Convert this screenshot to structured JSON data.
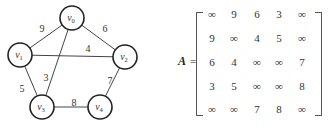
{
  "graph": {
    "nodes": [
      {
        "id": "v0",
        "base": "v",
        "sub": "0",
        "x": 72,
        "y": 18
      },
      {
        "id": "v1",
        "base": "v",
        "sub": "1",
        "x": 20,
        "y": 55
      },
      {
        "id": "v2",
        "base": "v",
        "sub": "2",
        "x": 125,
        "y": 57
      },
      {
        "id": "v3",
        "base": "v",
        "sub": "3",
        "x": 42,
        "y": 107
      },
      {
        "id": "v4",
        "base": "v",
        "sub": "4",
        "x": 100,
        "y": 107
      }
    ],
    "edges": [
      {
        "from": "v0",
        "to": "v1",
        "weight": "9",
        "lx": 42,
        "ly": 32
      },
      {
        "from": "v0",
        "to": "v2",
        "weight": "6",
        "lx": 105,
        "ly": 32
      },
      {
        "from": "v1",
        "to": "v2",
        "weight": "4",
        "lx": 88,
        "ly": 52
      },
      {
        "from": "v0",
        "to": "v3",
        "weight": "3",
        "lx": 46,
        "ly": 81
      },
      {
        "from": "v1",
        "to": "v3",
        "weight": "5",
        "lx": 22,
        "ly": 92
      },
      {
        "from": "v2",
        "to": "v4",
        "weight": "7",
        "lx": 110,
        "ly": 84
      },
      {
        "from": "v3",
        "to": "v4",
        "weight": "8",
        "lx": 74,
        "ly": 106
      }
    ]
  },
  "matrix": {
    "name": "A",
    "equals": "=",
    "rows": [
      [
        "∞",
        "9",
        "6",
        "3",
        "∞"
      ],
      [
        "9",
        "∞",
        "4",
        "5",
        "∞"
      ],
      [
        "6",
        "4",
        "∞",
        "∞",
        "7"
      ],
      [
        "3",
        "5",
        "∞",
        "∞",
        "8"
      ],
      [
        "∞",
        "∞",
        "7",
        "8",
        "∞"
      ]
    ]
  }
}
